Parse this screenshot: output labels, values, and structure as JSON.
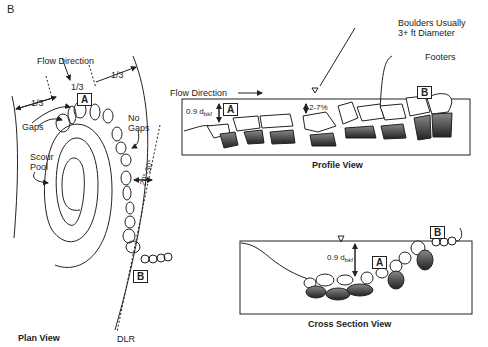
{
  "figure_label": "B",
  "plan_view": {
    "title": "Plan View",
    "flow_direction": "Flow Direction",
    "thirds": [
      "1/3",
      "1/3",
      "1/3"
    ],
    "label_a": "A",
    "label_b": "B",
    "gaps": "Gaps",
    "no_gaps": "No Gaps",
    "scour_pool": "Scour Pool",
    "angle": "20°-30°",
    "dlr": "DLR"
  },
  "profile_view": {
    "title": "Profile View",
    "flow_direction": "Flow Direction",
    "depth_label": "0.9 d",
    "depth_sub": "bkf",
    "slope": "2-7%",
    "label_a": "A",
    "label_b": "B",
    "boulders": "Boulders Usually",
    "boulders_line2": "3+ ft Diameter",
    "footers": "Footers"
  },
  "cross_section_view": {
    "title": "Cross Section View",
    "depth_label": "0.9 d",
    "depth_sub": "bkf",
    "label_a": "A",
    "label_b": "B"
  }
}
